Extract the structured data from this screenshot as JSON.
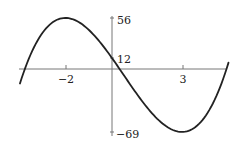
{
  "chart_data": {
    "type": "line",
    "title": "",
    "xlabel": "",
    "ylabel": "",
    "function": "f(x) = 2x^3 - 3x^2 - 36x + 12",
    "x_ticks": [
      -2,
      3
    ],
    "y_ticks": [
      56,
      12,
      -69
    ],
    "x_tick_labels": [
      "−2",
      "3"
    ],
    "y_tick_labels": [
      "56",
      "12",
      "−69"
    ],
    "xlim": [
      -4.0,
      5.0
    ],
    "ylim": [
      -72,
      62
    ],
    "grid": false,
    "legend": null,
    "series": [
      {
        "name": "f(x)",
        "color": "#222222",
        "x": [
          -3.8,
          -3.5,
          -3,
          -2.5,
          -2,
          -1.5,
          -1,
          -0.5,
          0,
          0.5,
          1,
          1.5,
          2,
          2.5,
          3,
          3.5,
          4,
          4.5,
          5.0
        ],
        "y": [
          -14.6,
          3.75,
          39,
          53.5,
          56,
          50.25,
          43,
          27.5,
          12,
          -6.5,
          -25,
          -43,
          -56,
          -66.5,
          -69,
          -64.25,
          -52,
          -31.8,
          -3
        ]
      }
    ],
    "annotations": [
      {
        "type": "y-intercept",
        "x": 0,
        "y": 12,
        "label": "12"
      },
      {
        "type": "local-max",
        "x": -2,
        "y": 56,
        "label": "56"
      },
      {
        "type": "local-min",
        "x": 3,
        "y": -69,
        "label": "−69"
      }
    ]
  }
}
